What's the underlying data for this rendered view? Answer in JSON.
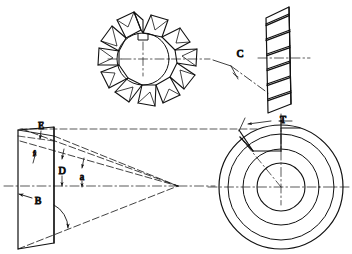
{
  "drawing": {
    "title": "Side milling cutter with staggered teeth - dimensioned views",
    "background_color": "#ffffff",
    "line_color": "#111111",
    "views": [
      {
        "id": "face-view",
        "name": "Cutter face view with staggered teeth",
        "tooth_count": 12
      },
      {
        "id": "edge-view",
        "name": "Cutter peripheral edge view with helical tooth lines",
        "tooth_lines": 7
      },
      {
        "id": "section-view",
        "name": "Tooth section development with cone apex"
      },
      {
        "id": "end-view",
        "name": "Cutter end view with concentric bore circles",
        "circle_count": 4
      }
    ],
    "labels": [
      {
        "key": "C",
        "text": "C",
        "x": 240,
        "y": 57,
        "meaning": "helix / side-cutting angle on edge view"
      },
      {
        "key": "T",
        "text": "T",
        "x": 283,
        "y": 123,
        "meaning": "tooth land width on end view"
      },
      {
        "key": "E",
        "text": "E",
        "x": 41,
        "y": 127,
        "meaning": "top corner reference on section view"
      },
      {
        "key": "f",
        "text": "f",
        "x": 35,
        "y": 156,
        "meaning": "relief angle on section view"
      },
      {
        "key": "D",
        "text": "D",
        "x": 62,
        "y": 174,
        "meaning": "cutter diameter dimension"
      },
      {
        "key": "a",
        "text": "a",
        "x": 82,
        "y": 180,
        "meaning": "rake / included angle"
      },
      {
        "key": "B",
        "text": "B",
        "x": 38,
        "y": 204,
        "meaning": "cutter width dimension"
      }
    ]
  }
}
